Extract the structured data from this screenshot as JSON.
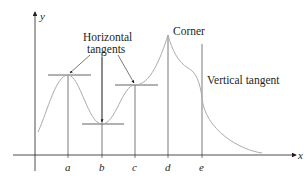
{
  "diagram": {
    "axes": {
      "x_label": "x",
      "y_label": "y"
    },
    "tick_labels": [
      "a",
      "b",
      "c",
      "d",
      "e"
    ],
    "annotations": {
      "horizontal_tangents_line1": "Horizontal",
      "horizontal_tangents_line2": "tangents",
      "corner": "Corner",
      "vertical_tangent": "Vertical tangent"
    },
    "colors": {
      "curve": "#b0aaa8",
      "axes": "#231f20",
      "text": "#231f20"
    }
  }
}
